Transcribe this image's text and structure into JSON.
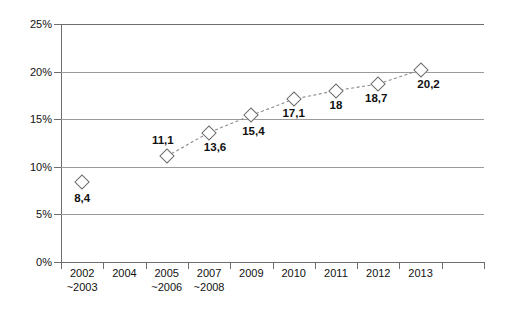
{
  "chart_data": {
    "type": "line",
    "title": "",
    "subtitle": "",
    "xlabel": "",
    "ylabel": "",
    "ylim": [
      0,
      25
    ],
    "grid": true,
    "legend": false,
    "legend_position": "none",
    "marker": "diamond",
    "line_style": "dashed",
    "decimal_separator": ",",
    "categories": [
      "2002\n~2003",
      "2004",
      "2005\n~2006",
      "2007\n~2008",
      "2009",
      "2010",
      "2011",
      "2012",
      "2013"
    ],
    "category_labels": [
      {
        "line1": "2002",
        "line2": "~2003"
      },
      {
        "line1": "2004",
        "line2": ""
      },
      {
        "line1": "2005",
        "line2": "~2006"
      },
      {
        "line1": "2007",
        "line2": "~2008"
      },
      {
        "line1": "2009",
        "line2": ""
      },
      {
        "line1": "2010",
        "line2": ""
      },
      {
        "line1": "2011",
        "line2": ""
      },
      {
        "line1": "2012",
        "line2": ""
      },
      {
        "line1": "2013",
        "line2": ""
      }
    ],
    "y_ticks": [
      0,
      5,
      10,
      15,
      20,
      25
    ],
    "y_tick_labels": [
      "0%",
      "5%",
      "10%",
      "15%",
      "20%",
      "25%"
    ],
    "values": [
      8.4,
      null,
      11.1,
      13.6,
      15.4,
      17.1,
      18.0,
      18.7,
      20.2
    ],
    "point_labels": [
      "8,4",
      "",
      "11,1",
      "13,6",
      "15,4",
      "17,1",
      "18",
      "18,7",
      "20,2"
    ],
    "colors": {
      "marker_stroke": "#6b6b6b",
      "marker_fill": "#ffffff",
      "line": "#8a8a8a",
      "gridline": "#9a9a9a",
      "axis": "#6e6e6e",
      "text": "#111111",
      "background": "#ffffff"
    }
  }
}
